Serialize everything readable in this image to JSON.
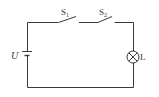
{
  "diagram": {
    "type": "circuit",
    "components": {
      "battery": {
        "label": "U"
      },
      "switch1": {
        "label_main": "S",
        "label_sub": "1"
      },
      "switch2": {
        "label_main": "S",
        "label_sub": "2"
      },
      "lamp": {
        "label": "L"
      }
    },
    "colors": {
      "line": "#3a3a3a",
      "text": "#333333",
      "background": "#ffffff"
    }
  }
}
